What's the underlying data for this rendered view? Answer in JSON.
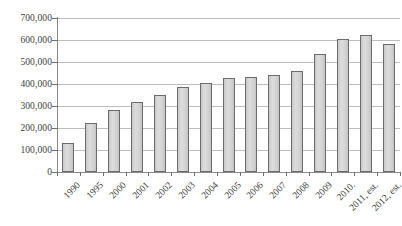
{
  "chart_data": {
    "type": "bar",
    "title": "",
    "subtitle": "",
    "xlabel": "",
    "ylabel": "",
    "ylim": [
      0,
      700000
    ],
    "ytick_step": 100000,
    "ytick_labels": [
      "0",
      "100,000",
      "200,000",
      "300,000",
      "400,000",
      "500,000",
      "600,000",
      "700,000"
    ],
    "ytick_values": [
      0,
      100000,
      200000,
      300000,
      400000,
      500000,
      600000,
      700000
    ],
    "grid": true,
    "legend": false,
    "legend_position": "none",
    "categories": [
      "1990",
      "1995",
      "2000",
      "2001",
      "2002",
      "2003",
      "2004",
      "2005",
      "2006",
      "2007",
      "2008",
      "2009",
      "2010.",
      "2011, est.",
      "2012, est."
    ],
    "values": [
      132000,
      224000,
      282000,
      318000,
      351000,
      388000,
      404000,
      427000,
      433000,
      440000,
      459000,
      535000,
      605000,
      622000,
      583000
    ],
    "bar_fill_color": "#d2d2d2",
    "bar_border_color": "#6b6b6b",
    "gridline_color": "#bdbdbd",
    "axis_color": "#8a8a8a",
    "text_color": "#3d3d3d",
    "background_color": "#ffffff"
  }
}
